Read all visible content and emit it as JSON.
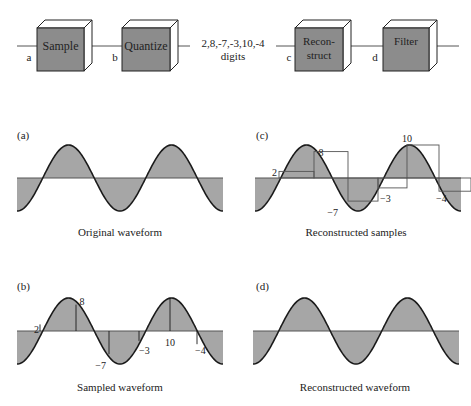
{
  "pipeline": {
    "blocks": [
      {
        "id": "sample",
        "label_lines": [
          "Sample"
        ]
      },
      {
        "id": "quantize",
        "label_lines": [
          "Quantize"
        ]
      },
      {
        "id": "reconstruct",
        "label_lines": [
          "Recon-",
          "struct"
        ]
      },
      {
        "id": "filter",
        "label_lines": [
          "Filter"
        ]
      }
    ],
    "signal_labels": [
      "a",
      "b",
      "c",
      "d"
    ],
    "digits_line1": "2,8,-7,-3,10,-4",
    "digits_line2": "digits"
  },
  "panels": {
    "a": {
      "tag": "(a)",
      "caption": "Original waveform"
    },
    "b": {
      "tag": "(b)",
      "caption": "Sampled waveform",
      "sample_labels": [
        "2",
        "8",
        "−7",
        "−3",
        "10",
        "−4"
      ]
    },
    "c": {
      "tag": "(c)",
      "caption": "Reconstructed samples",
      "sample_labels": [
        "2",
        "8",
        "−7",
        "−3",
        "10",
        "−4"
      ]
    },
    "d": {
      "tag": "(d)",
      "caption": "Reconstructed waveform"
    }
  },
  "samples": [
    2,
    8,
    -7,
    -3,
    10,
    -4
  ],
  "colors": {
    "fill": "#a6a6a6",
    "box_front": "#8c8c8c",
    "stroke": "#1a1a1a",
    "line": "#555555"
  }
}
